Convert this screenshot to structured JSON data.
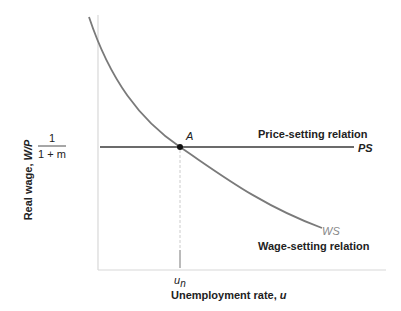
{
  "diagram": {
    "y_axis_label": "Real wage, ",
    "y_axis_var": "W/P",
    "x_axis_label": "Unemployment rate, ",
    "x_axis_var": "u",
    "y_tick_num": "1",
    "y_tick_den": "1 + m",
    "x_tick": "u",
    "x_tick_sub": "n",
    "point_label": "A",
    "ps_relation_label": "Price-setting relation",
    "ps_label": "PS",
    "ws_relation_label": "Wage-setting relation",
    "ws_label": "WS",
    "colors": {
      "axis": "#d8d8d8",
      "ps_line": "#6b6b6b",
      "ws_curve": "#7a7a7a",
      "dashed": "#cccccc",
      "point": "#111111",
      "ws_text": "#888888"
    }
  }
}
